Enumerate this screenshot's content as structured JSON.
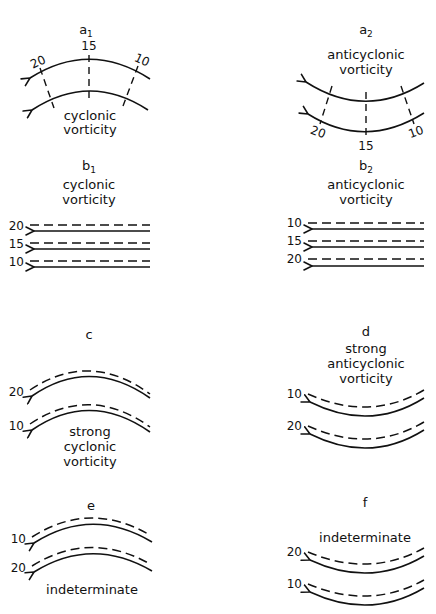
{
  "panels": {
    "a1": {
      "letter": "a",
      "sub": "1",
      "caption_1": "cyclonic",
      "caption_2": "vorticity",
      "iso": [
        "20",
        "15",
        "10"
      ]
    },
    "a2": {
      "letter": "a",
      "sub": "2",
      "caption_1": "anticyclonic",
      "caption_2": "vorticity",
      "iso": [
        "20",
        "15",
        "10"
      ]
    },
    "b1": {
      "letter": "b",
      "sub": "1",
      "caption_1": "cyclonic",
      "caption_2": "vorticity",
      "iso": [
        "20",
        "15",
        "10"
      ]
    },
    "b2": {
      "letter": "b",
      "sub": "2",
      "caption_1": "anticyclonic",
      "caption_2": "vorticity",
      "iso": [
        "10",
        "15",
        "20"
      ]
    },
    "c": {
      "letter": "c",
      "caption_1": "strong",
      "caption_2": "cyclonic",
      "caption_3": "vorticity",
      "iso": [
        "20",
        "10"
      ]
    },
    "d": {
      "letter": "d",
      "caption_1": "strong",
      "caption_2": "anticyclonic",
      "caption_3": "vorticity",
      "iso": [
        "10",
        "20"
      ]
    },
    "e": {
      "letter": "e",
      "caption_1": "indeterminate",
      "iso": [
        "10",
        "20"
      ]
    },
    "f": {
      "letter": "f",
      "caption_1": "indeterminate",
      "iso": [
        "20",
        "10"
      ]
    }
  }
}
